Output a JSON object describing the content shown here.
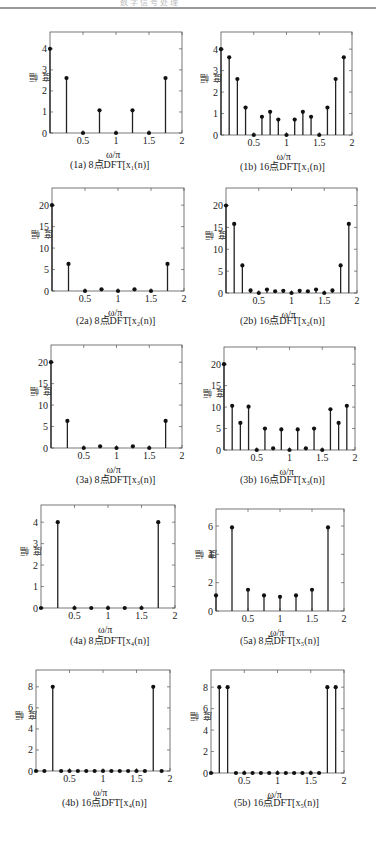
{
  "page": {
    "header_text": "数 字 信 号 处 理"
  },
  "common": {
    "ylabel": "幅度",
    "xlabel": "ω/π",
    "xticks": [
      "0.5",
      "1",
      "1.5",
      "2"
    ]
  },
  "panels": [
    {
      "id": "1a",
      "caption": "(1a) 8点DFT[x₁(n)]"
    },
    {
      "id": "1b",
      "caption": "(1b) 16点DFT[x₁(n)]"
    },
    {
      "id": "2a",
      "caption": "(2a) 8点DFT[x₂(n)]"
    },
    {
      "id": "2b",
      "caption": "(2b) 16点DFT[x₂(n)]"
    },
    {
      "id": "3a",
      "caption": "(3a) 8点DFT[x₃(n)]"
    },
    {
      "id": "3b",
      "caption": "(3b) 16点DFT[x₃(n)]"
    },
    {
      "id": "4a",
      "caption": "(4a) 8点DFT[x₄(n)]"
    },
    {
      "id": "5a",
      "caption": "(5a) 8点DFT[x₅(n)]"
    },
    {
      "id": "4b",
      "caption": "(4b) 16点DFT[x₄(n)]"
    },
    {
      "id": "5b",
      "caption": "(5b) 16点DFT[x₅(n)]"
    }
  ],
  "chart_data": [
    {
      "type": "stem",
      "title": "(1a) 8点DFT[x₁(n)]",
      "xlabel": "ω/π",
      "ylabel": "幅度",
      "x": [
        0,
        0.25,
        0.5,
        0.75,
        1,
        1.25,
        1.5,
        1.75
      ],
      "values": [
        4,
        2.61,
        0,
        1.08,
        0,
        1.08,
        0,
        2.61
      ],
      "xlim": [
        0,
        2
      ],
      "ylim": [
        0,
        4.8
      ],
      "yticks": [
        0,
        1,
        2,
        3,
        4
      ]
    },
    {
      "type": "stem",
      "title": "(1b) 16点DFT[x₁(n)]",
      "xlabel": "ω/π",
      "ylabel": "幅度",
      "x": [
        0,
        0.125,
        0.25,
        0.375,
        0.5,
        0.625,
        0.75,
        0.875,
        1,
        1.125,
        1.25,
        1.375,
        1.5,
        1.625,
        1.75,
        1.875
      ],
      "values": [
        4,
        3.62,
        2.61,
        1.28,
        0,
        0.85,
        1.08,
        0.72,
        0,
        0.72,
        1.08,
        0.85,
        0,
        1.28,
        2.61,
        3.62
      ],
      "xlim": [
        0,
        2
      ],
      "ylim": [
        0,
        4.8
      ],
      "yticks": [
        0,
        1,
        2,
        3,
        4
      ]
    },
    {
      "type": "stem",
      "title": "(2a) 8点DFT[x₂(n)]",
      "xlabel": "ω/π",
      "ylabel": "幅度",
      "x": [
        0,
        0.25,
        0.5,
        0.75,
        1,
        1.25,
        1.5,
        1.75
      ],
      "values": [
        20,
        6.3,
        0,
        0.4,
        0,
        0.4,
        0,
        6.3
      ],
      "xlim": [
        0,
        2
      ],
      "ylim": [
        0,
        24
      ],
      "yticks": [
        0,
        5,
        10,
        15,
        20
      ]
    },
    {
      "type": "stem",
      "title": "(2b) 16点DFT[x₂(n)]",
      "xlabel": "ω/π",
      "ylabel": "幅度",
      "x": [
        0,
        0.125,
        0.25,
        0.375,
        0.5,
        0.625,
        0.75,
        0.875,
        1,
        1.125,
        1.25,
        1.375,
        1.5,
        1.625,
        1.75,
        1.875
      ],
      "values": [
        20,
        15.8,
        6.3,
        0.6,
        0,
        0.8,
        0.4,
        0.5,
        0,
        0.5,
        0.4,
        0.8,
        0,
        0.6,
        6.3,
        15.8
      ],
      "xlim": [
        0,
        2
      ],
      "ylim": [
        0,
        24
      ],
      "yticks": [
        0,
        5,
        10,
        15,
        20
      ]
    },
    {
      "type": "stem",
      "title": "(3a) 8点DFT[x₃(n)]",
      "xlabel": "ω/π",
      "ylabel": "幅度",
      "x": [
        0,
        0.25,
        0.5,
        0.75,
        1,
        1.25,
        1.5,
        1.75
      ],
      "values": [
        20,
        6.3,
        0,
        0.4,
        0,
        0.4,
        0,
        6.3
      ],
      "xlim": [
        0,
        2
      ],
      "ylim": [
        0,
        24
      ],
      "yticks": [
        0,
        5,
        10,
        15,
        20
      ]
    },
    {
      "type": "stem",
      "title": "(3b) 16点DFT[x₃(n)]",
      "xlabel": "ω/π",
      "ylabel": "幅度",
      "x": [
        0,
        0.125,
        0.25,
        0.375,
        0.5,
        0.625,
        0.75,
        0.875,
        1,
        1.125,
        1.25,
        1.375,
        1.5,
        1.625,
        1.75,
        1.875
      ],
      "values": [
        20,
        10.3,
        6.3,
        10.1,
        0,
        5.0,
        0.4,
        4.8,
        0,
        4.8,
        0.4,
        5.0,
        0,
        9.5,
        6.3,
        10.3
      ],
      "xlim": [
        0,
        2
      ],
      "ylim": [
        0,
        24
      ],
      "yticks": [
        0,
        5,
        10,
        15,
        20
      ]
    },
    {
      "type": "stem",
      "title": "(4a) 8点DFT[x₄(n)]",
      "xlabel": "ω/π",
      "ylabel": "幅度",
      "x": [
        0,
        0.25,
        0.5,
        0.75,
        1,
        1.25,
        1.5,
        1.75
      ],
      "values": [
        0,
        4,
        0,
        0,
        0,
        0,
        0,
        4
      ],
      "xlim": [
        0,
        2
      ],
      "ylim": [
        0,
        4.8
      ],
      "yticks": [
        0,
        1,
        2,
        3,
        4
      ]
    },
    {
      "type": "stem",
      "title": "(5a) 8点DFT[x₅(n)]",
      "xlabel": "ω/π",
      "ylabel": "幅度",
      "x": [
        0,
        0.25,
        0.5,
        0.75,
        1,
        1.25,
        1.5,
        1.75
      ],
      "values": [
        1.1,
        5.9,
        1.5,
        1.1,
        1.0,
        1.1,
        1.5,
        5.9
      ],
      "xlim": [
        0,
        2
      ],
      "ylim": [
        0,
        7.2
      ],
      "yticks": [
        0,
        2,
        4,
        6
      ]
    },
    {
      "type": "stem",
      "title": "(4b) 16点DFT[x₄(n)]",
      "xlabel": "ω/π",
      "ylabel": "幅度",
      "x": [
        0,
        0.125,
        0.25,
        0.375,
        0.5,
        0.625,
        0.75,
        0.875,
        1,
        1.125,
        1.25,
        1.375,
        1.5,
        1.625,
        1.75,
        1.875
      ],
      "values": [
        0,
        0,
        8,
        0,
        0,
        0,
        0,
        0,
        0,
        0,
        0,
        0,
        0,
        0,
        8,
        0
      ],
      "xlim": [
        0,
        2
      ],
      "ylim": [
        0,
        9.6
      ],
      "yticks": [
        0,
        2,
        4,
        6,
        8
      ]
    },
    {
      "type": "stem",
      "title": "(5b) 16点DFT[x₅(n)]",
      "xlabel": "ω/π",
      "ylabel": "幅度",
      "x": [
        0,
        0.125,
        0.25,
        0.375,
        0.5,
        0.625,
        0.75,
        0.875,
        1,
        1.125,
        1.25,
        1.375,
        1.5,
        1.625,
        1.75,
        1.875
      ],
      "values": [
        0,
        8,
        8,
        0,
        0,
        0,
        0,
        0,
        0,
        0,
        0,
        0,
        0,
        0,
        8,
        8
      ],
      "xlim": [
        0,
        2
      ],
      "ylim": [
        0,
        9.6
      ],
      "yticks": [
        0,
        2,
        4,
        6,
        8
      ]
    }
  ]
}
